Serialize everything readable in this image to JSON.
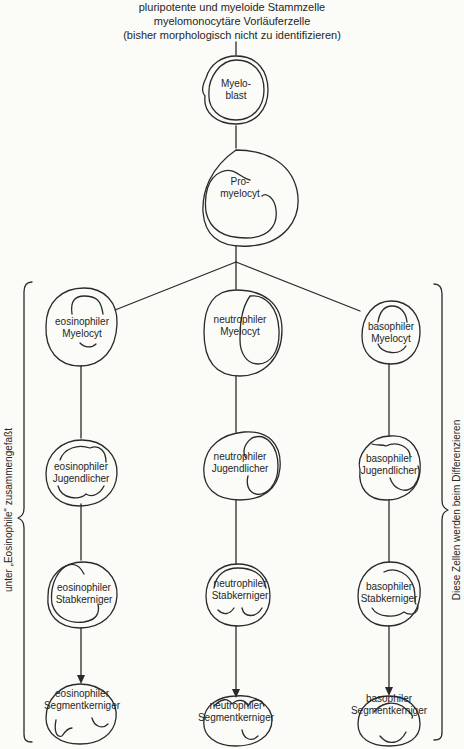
{
  "header": {
    "line1": "pluripotente und myeloide Stammzelle",
    "line2": "myelomonocytäre Vorläuferzelle",
    "line3": "(bisher morphologisch nicht zu identifizieren)"
  },
  "cells": {
    "myeloblast": {
      "line1": "Myelo-",
      "line2": "blast"
    },
    "promyelocyt": {
      "line1": "Pro-",
      "line2": "myelocyt"
    },
    "eos_myelocyt": {
      "line1": "eosinophiler",
      "line2": "Myelocyt"
    },
    "neu_myelocyt": {
      "line1": "neutrophiler",
      "line2": "Myelocyt"
    },
    "bas_myelocyt": {
      "line1": "basophiler",
      "line2": "Myelocyt"
    },
    "eos_jugend": {
      "line1": "eosinophiler",
      "line2": "Jugendlicher"
    },
    "neu_jugend": {
      "line1": "neutrophiler",
      "line2": "Jugendlicher"
    },
    "bas_jugend": {
      "line1": "basophiler",
      "line2": "Jugendlicher"
    },
    "eos_stab": {
      "line1": "eosinophiler",
      "line2": "Stabkerniger"
    },
    "neu_stab": {
      "line1": "neutrophiler",
      "line2": "Stabkerniger"
    },
    "bas_stab": {
      "line1": "basophiler",
      "line2": "Stabkerniger"
    },
    "eos_segment": {
      "line1": "eosinophiler",
      "line2": "Segmentkerniger"
    },
    "neu_segment": {
      "line1": "neutrophiler",
      "line2": "Segmentkerniger"
    },
    "bas_segment": {
      "line1": "basophiler",
      "line2": "Segmentkerniger"
    }
  },
  "brackets": {
    "left_label": "unter „Eosinophile“ zusammengefaßt",
    "right_label": "Diese Zellen werden beim Differenzieren"
  },
  "colors": {
    "line": "#2a2a2a",
    "text": "#262626",
    "background": "#fbfbf8"
  }
}
